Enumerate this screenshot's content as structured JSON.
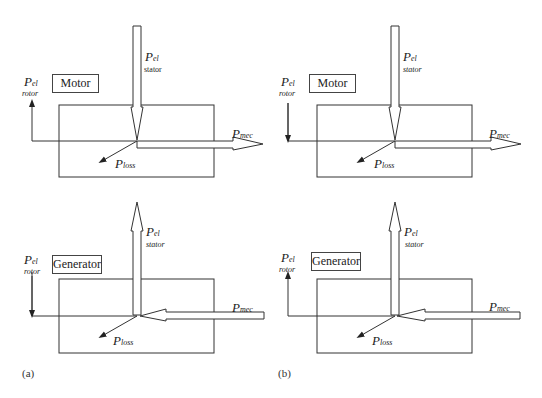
{
  "panels": [
    {
      "tag": "(a)",
      "motor": {
        "mode": "Motor",
        "p": "P",
        "el_sub": "el",
        "rotor_sub": "rotor",
        "stator_sub": "stator",
        "mec_sub": "mec",
        "loss_sub": "loss",
        "rotor_direction": "out"
      },
      "generator": {
        "mode": "Generator",
        "p": "P",
        "el_sub": "el",
        "rotor_sub": "rotor",
        "stator_sub": "stator",
        "mec_sub": "mec",
        "loss_sub": "loss",
        "rotor_direction": "in"
      }
    },
    {
      "tag": "(b)",
      "motor": {
        "mode": "Motor",
        "p": "P",
        "el_sub": "el",
        "rotor_sub": "rotor",
        "stator_sub": "stator",
        "mec_sub": "mec",
        "loss_sub": "loss",
        "rotor_direction": "in"
      },
      "generator": {
        "mode": "Generator",
        "p": "P",
        "el_sub": "el",
        "rotor_sub": "rotor",
        "stator_sub": "stator",
        "mec_sub": "mec",
        "loss_sub": "loss",
        "rotor_direction": "out"
      }
    }
  ],
  "colors": {
    "stroke": "#333333",
    "background": "#ffffff"
  }
}
